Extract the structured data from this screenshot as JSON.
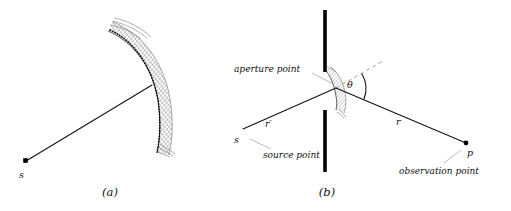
{
  "figure": {
    "panels": [
      {
        "id": "a",
        "caption": "(a)",
        "source_label": "s",
        "description_elements": {
          "aperture": "curved-hatched-band",
          "ray": "source-to-aperture-ray",
          "dotted_curve": "aperture-sample-points"
        }
      },
      {
        "id": "b",
        "caption": "(b)",
        "source_label": "s",
        "observation_label": "p",
        "incident_ray_label": "r′",
        "outgoing_ray_label": "r",
        "angle_label": "θ",
        "annotations": [
          "aperture point",
          "source point",
          "observation point"
        ],
        "aperture_point_label": "aperture point",
        "source_point_label": "source point",
        "observation_point_label": "observation point"
      }
    ],
    "colors": {
      "ink": "#111111",
      "screen": "#000000",
      "hatch": "#4a4a4a",
      "leader": "#8a8a8a",
      "dashed_normal": "#9a9a9a",
      "background": "#ffffff"
    }
  }
}
